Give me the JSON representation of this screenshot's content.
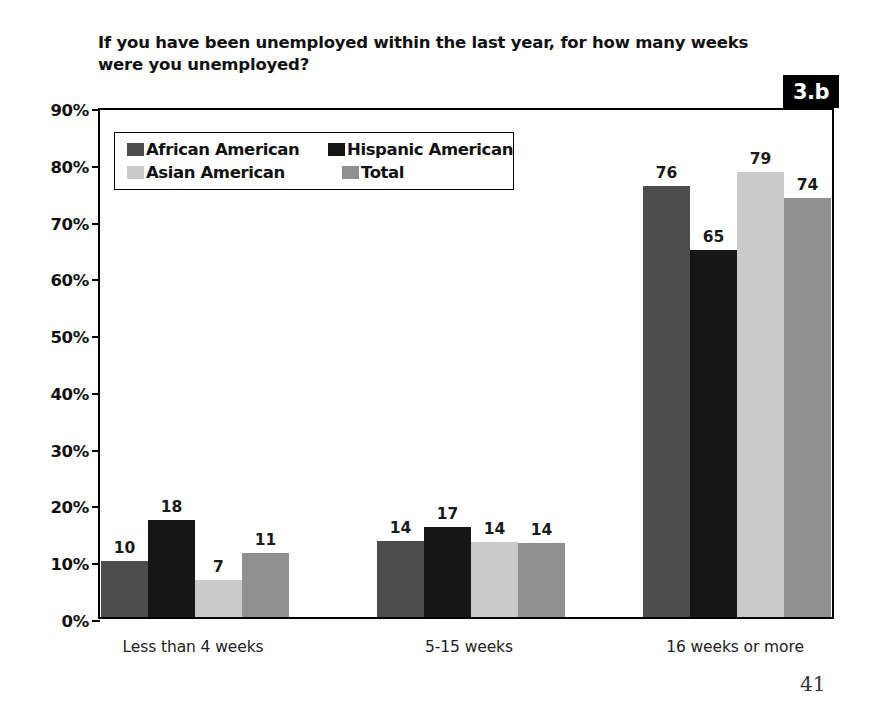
{
  "figure": {
    "badge_label": "3.b",
    "page_number": "41",
    "title": "If you have been unemployed within the last year, for how many weeks were you unemployed?"
  },
  "chart_data": {
    "type": "bar",
    "title": "If you have been unemployed within the last year, for how many weeks were you unemployed?",
    "xlabel": "",
    "ylabel": "",
    "ylim": [
      0,
      90
    ],
    "y_tick_labels": [
      "0%",
      "10%",
      "20%",
      "30%",
      "40%",
      "50%",
      "60%",
      "70%",
      "80%",
      "90%"
    ],
    "y_tick_values": [
      0,
      10,
      20,
      30,
      40,
      50,
      60,
      70,
      80,
      90
    ],
    "grid": false,
    "legend_position": "upper-left-inside",
    "categories": [
      "Less than 4 weeks",
      "5-15 weeks",
      "16 weeks or more"
    ],
    "series": [
      {
        "name": "African American",
        "color": "#4d4d4d",
        "values": [
          10,
          14,
          76
        ],
        "plotted_heights": [
          9.8,
          13.4,
          76.0
        ],
        "labels": [
          "10",
          "14",
          "76"
        ]
      },
      {
        "name": "Hispanic American",
        "color": "#161616",
        "values": [
          18,
          17,
          65
        ],
        "plotted_heights": [
          17.1,
          15.8,
          64.7
        ],
        "labels": [
          "18",
          "17",
          "65"
        ]
      },
      {
        "name": "Asian American",
        "color": "#cacaca",
        "values": [
          7,
          14,
          79
        ],
        "plotted_heights": [
          6.5,
          13.3,
          78.4
        ],
        "labels": [
          "7",
          "14",
          "79"
        ]
      },
      {
        "name": "Total",
        "color": "#909090",
        "values": [
          11,
          14,
          74
        ],
        "plotted_heights": [
          11.3,
          13.1,
          73.8
        ],
        "labels": [
          "11",
          "14",
          "74"
        ]
      }
    ]
  }
}
